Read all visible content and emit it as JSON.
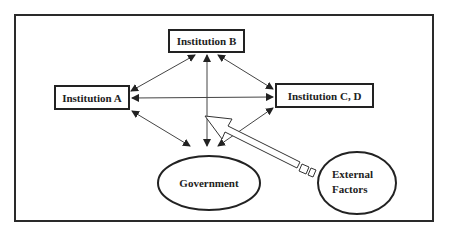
{
  "diagram": {
    "type": "institutional-relations",
    "nodes": {
      "institution_b": {
        "label": "Institution B",
        "shape": "rectangle"
      },
      "institution_a": {
        "label": "Institution A",
        "shape": "rectangle"
      },
      "institution_cd": {
        "label": "Institution C, D",
        "shape": "rectangle"
      },
      "government": {
        "label": "Government",
        "shape": "ellipse"
      },
      "external_factors": {
        "label_line1": "External",
        "label_line2": "Factors",
        "shape": "ellipse"
      }
    },
    "edges": [
      {
        "from": "institution_a",
        "to": "institution_b",
        "style": "double-arrow"
      },
      {
        "from": "institution_b",
        "to": "institution_cd",
        "style": "double-arrow"
      },
      {
        "from": "institution_a",
        "to": "institution_cd",
        "style": "double-arrow"
      },
      {
        "from": "institution_a",
        "to": "government",
        "style": "double-arrow"
      },
      {
        "from": "institution_cd",
        "to": "government",
        "style": "double-arrow"
      },
      {
        "from": "institution_b",
        "to": "government",
        "style": "double-arrow"
      },
      {
        "from": "external_factors",
        "to": "center",
        "style": "block-arrow"
      }
    ],
    "colors": {
      "stroke": "#222222",
      "background": "#ffffff"
    }
  }
}
